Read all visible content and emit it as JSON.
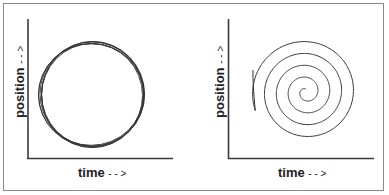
{
  "panels": [
    {
      "name": "oscillation",
      "xlabel": "time",
      "xlabel_arrow": "- - >",
      "ylabel": "position",
      "ylabel_arrow": "- - >",
      "curve": "closed-loop circle (repeated orbits)"
    },
    {
      "name": "damped-spiral",
      "xlabel": "time",
      "xlabel_arrow": "- - >",
      "ylabel": "position",
      "ylabel_arrow": "- - >",
      "curve": "inward spiral"
    }
  ],
  "colors": {
    "axis": "#3a3a3a",
    "curve": "#333333",
    "frame": "#8a8a8a",
    "text": "#222222"
  }
}
